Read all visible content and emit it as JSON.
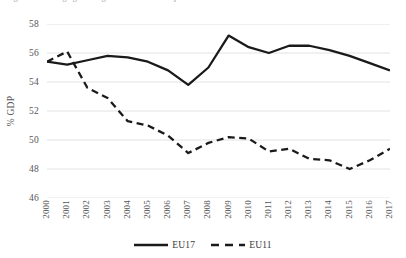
{
  "figure": {
    "title": "Figure 1: Average general government total expenditure",
    "y_axis_title": "% GDP"
  },
  "legend": {
    "position": "bottom-center",
    "entries": [
      {
        "label": "EU17",
        "style": "solid",
        "color": "#1a1a1a"
      },
      {
        "label": "EU11",
        "style": "dashed",
        "color": "#1a1a1a"
      }
    ]
  },
  "chart_data": {
    "type": "line",
    "title": "Figure 1: Average general government total expenditure",
    "xlabel": "",
    "ylabel": "% GDP",
    "ylim": [
      46,
      58
    ],
    "ytick_step": 2,
    "yticks": [
      58,
      56,
      54,
      52,
      50,
      48,
      46
    ],
    "grid": "horizontal",
    "legend_position": "bottom-center",
    "x": [
      "2000",
      "2001",
      "2002",
      "2003",
      "2004",
      "2005",
      "2006",
      "2007",
      "2008",
      "2009",
      "2010",
      "2011",
      "2012",
      "2013",
      "2014",
      "2015",
      "2016",
      "2017"
    ],
    "series": [
      {
        "name": "EU17",
        "style": "solid",
        "color": "#1a1a1a",
        "values": [
          55.4,
          55.2,
          55.5,
          55.8,
          55.7,
          55.4,
          54.8,
          53.8,
          55.0,
          57.2,
          56.4,
          56.0,
          56.5,
          56.5,
          56.2,
          55.8,
          55.3,
          54.8
        ]
      },
      {
        "name": "EU11",
        "style": "dashed",
        "color": "#1a1a1a",
        "values": [
          55.4,
          56.1,
          53.6,
          52.9,
          51.3,
          51.0,
          50.3,
          49.1,
          49.8,
          50.2,
          50.1,
          49.2,
          49.4,
          48.7,
          48.6,
          48.0,
          48.6,
          49.4
        ]
      }
    ]
  }
}
